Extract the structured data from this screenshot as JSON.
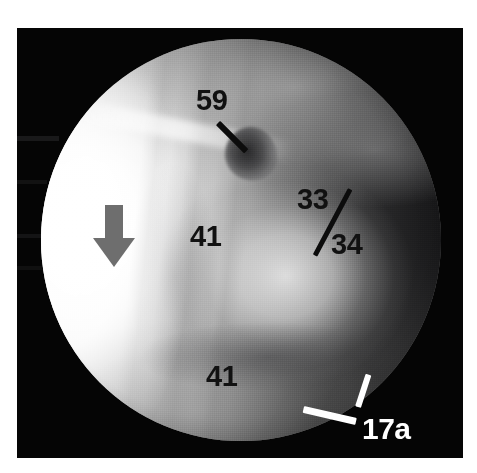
{
  "figure": {
    "kind": "endoscopic-photograph",
    "background_color": "#ffffff",
    "plate_color": "#050505",
    "field_shape": "circle"
  },
  "annotations": {
    "labels": [
      {
        "id": "label-59",
        "text": "59",
        "color": "#111111",
        "style": "dark",
        "x": 196,
        "y": 86,
        "size": 29,
        "leader": {
          "length": 40,
          "angle": 45,
          "thickness": 6,
          "color": "#0c0c0c",
          "from_x": 218,
          "from_y": 120
        }
      },
      {
        "id": "label-41-upper",
        "text": "41",
        "color": "#111111",
        "style": "dark",
        "x": 190,
        "y": 222,
        "size": 29,
        "leader": null
      },
      {
        "id": "label-33",
        "text": "33",
        "color": "#111111",
        "style": "dark",
        "x": 297,
        "y": 185,
        "size": 29,
        "leader": null
      },
      {
        "id": "label-34",
        "text": "34",
        "color": "#111111",
        "style": "dark",
        "x": 331,
        "y": 230,
        "size": 29,
        "leader": null
      },
      {
        "id": "label-41-lower",
        "text": "41",
        "color": "#111111",
        "style": "dark",
        "x": 206,
        "y": 362,
        "size": 29,
        "leader": null
      },
      {
        "id": "label-17a",
        "text": "17a",
        "color": "#ffffff",
        "style": "light",
        "x": 362,
        "y": 414,
        "size": 30,
        "leader": null
      }
    ],
    "rules": [
      {
        "id": "rule-33-34",
        "color": "#0c0c0c",
        "note": "diagonal divider between labels 33 and 34",
        "x": 315,
        "y": 253,
        "length": 75,
        "angle": -62,
        "thickness": 5
      },
      {
        "id": "leader-17a-upper",
        "color": "#ffffff",
        "note": "white leader from 17a to tissue rim",
        "x": 358,
        "y": 404,
        "length": 34,
        "angle": -72,
        "thickness": 6
      },
      {
        "id": "leader-17a-lower",
        "color": "#ffffff",
        "note": "white leader from 17a to scope margin",
        "x": 356,
        "y": 418,
        "length": 54,
        "angle": 193,
        "thickness": 7
      }
    ],
    "markers": [
      {
        "id": "marker-arrow",
        "shape": "arrow-down",
        "color": "#6e6e6e",
        "x": 93,
        "y": 205
      }
    ]
  },
  "legend_values": {
    "structure_59": "59",
    "structure_41": "41",
    "structure_33": "33",
    "structure_34": "34",
    "structure_17a": "17a"
  }
}
